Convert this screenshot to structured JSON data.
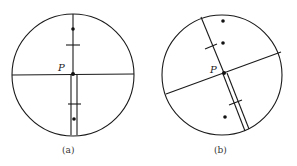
{
  "top_fragment": "安装误差",
  "panels": [
    {
      "id": "a",
      "caption": "(a)",
      "point_label": "P",
      "description": "Circular field of view with vertical and horizontal crosshair; vertical double-line reticle below P; two dots and two tick marks along vertical axis"
    },
    {
      "id": "b",
      "caption": "(b)",
      "point_label": "P",
      "description": "Same field rotated: tilted crosshair through P; double-line reticle along tilted axis; three dots remain in vertical column"
    }
  ],
  "colors": {
    "line": "#1a1a1a",
    "background": "#ffffff"
  }
}
